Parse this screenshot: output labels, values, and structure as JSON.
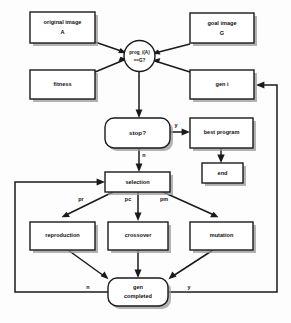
{
  "diagram": {
    "colors": {
      "stroke": "#1a1a1a",
      "fill": "#ffffff",
      "shadow": "#9a9a9a",
      "background": "#fdfdfd"
    },
    "nodes": {
      "original_image": {
        "line1": "original image",
        "line2": "A"
      },
      "goal_image": {
        "line1": "goal image",
        "line2": "G"
      },
      "fitness": {
        "line1": "fitness"
      },
      "gen_i": {
        "line1": "gen i"
      },
      "test_circle": {
        "line1": "prog_i(A)",
        "line2": "==G?"
      },
      "stop": {
        "line1": "stop?"
      },
      "best_program": {
        "line1": "best program"
      },
      "end": {
        "line1": "end"
      },
      "selection": {
        "line1": "selection"
      },
      "reproduction": {
        "line1": "reproduction"
      },
      "crossover": {
        "line1": "crossover"
      },
      "mutation": {
        "line1": "mutation"
      },
      "gen_completed": {
        "line1": "gen",
        "line2": "completed"
      }
    },
    "edge_labels": {
      "stop_yes": "y",
      "stop_no": "n",
      "prob_reproduction": "pr",
      "prob_crossover": "pc",
      "prob_mutation": "pm",
      "gen_no": "n",
      "gen_yes": "y"
    }
  }
}
